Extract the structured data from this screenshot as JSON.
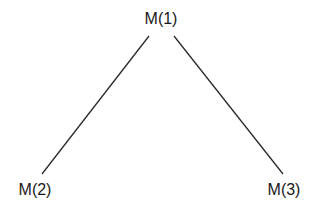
{
  "diagram": {
    "type": "tree",
    "nodes": [
      {
        "id": "m1",
        "label": "M(1)",
        "x": 161,
        "y": 11
      },
      {
        "id": "m2",
        "label": "M(2)",
        "x": 35,
        "y": 182
      },
      {
        "id": "m3",
        "label": "M(3)",
        "x": 284,
        "y": 182
      }
    ],
    "edges": [
      {
        "from": "m1",
        "to": "m2",
        "x1": 149,
        "y1": 36,
        "x2": 42,
        "y2": 174
      },
      {
        "from": "m1",
        "to": "m3",
        "x1": 174,
        "y1": 36,
        "x2": 283,
        "y2": 174
      }
    ],
    "colors": {
      "line": "#2a2a2a",
      "text": "#1a1a1a",
      "background": "#ffffff"
    }
  }
}
